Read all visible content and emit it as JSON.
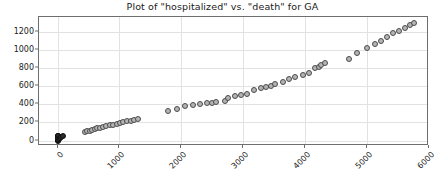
{
  "chart_data": {
    "type": "scatter",
    "title": "Plot of \"hospitalized\" vs. \"death\" for GA",
    "xlabel": "",
    "ylabel": "",
    "xlim": [
      -300,
      6000
    ],
    "ylim": [
      -60,
      1360
    ],
    "grid": true,
    "legend": null,
    "marker": {
      "shape": "circle",
      "facecolor": "#b4b4b4",
      "edgecolor": "#4c4c4c",
      "size": 6
    },
    "xticks": [
      0,
      1000,
      2000,
      3000,
      4000,
      5000,
      6000
    ],
    "xtick_labels": [
      "0",
      "1000",
      "2000",
      "3000",
      "4000",
      "5000",
      "6000"
    ],
    "xtick_rotation": -45,
    "yticks": [
      0,
      200,
      400,
      600,
      800,
      1000,
      1200
    ],
    "ytick_labels": [
      "0",
      "200",
      "400",
      "600",
      "800",
      "1000",
      "1200"
    ],
    "series_name": "hospitalized vs death",
    "x": [
      0,
      0,
      0,
      0,
      0,
      0,
      0,
      0,
      0,
      0,
      0,
      0,
      0,
      0,
      0,
      0,
      0,
      0,
      20,
      40,
      60,
      80,
      440,
      480,
      520,
      560,
      600,
      640,
      690,
      740,
      790,
      840,
      900,
      960,
      1010,
      1060,
      1120,
      1180,
      1240,
      1300,
      1790,
      1930,
      2060,
      2180,
      2300,
      2420,
      2500,
      2560,
      2700,
      2760,
      2860,
      2960,
      3060,
      3180,
      3280,
      3360,
      3440,
      3520,
      3640,
      3740,
      3840,
      3960,
      4060,
      4160,
      4220,
      4260,
      4320,
      4700,
      4840,
      5000,
      5120,
      5220,
      5320,
      5420,
      5520,
      5620,
      5700,
      5760
    ],
    "y": [
      0,
      5,
      10,
      14,
      18,
      22,
      26,
      30,
      34,
      38,
      42,
      46,
      50,
      54,
      12,
      8,
      4,
      2,
      20,
      30,
      40,
      50,
      90,
      100,
      110,
      118,
      126,
      134,
      142,
      150,
      158,
      166,
      175,
      184,
      192,
      200,
      210,
      218,
      226,
      234,
      330,
      352,
      380,
      390,
      400,
      408,
      416,
      424,
      440,
      470,
      486,
      500,
      516,
      560,
      576,
      590,
      604,
      618,
      650,
      680,
      700,
      724,
      748,
      800,
      812,
      830,
      850,
      900,
      960,
      1020,
      1060,
      1100,
      1140,
      1180,
      1210,
      1240,
      1270,
      1290
    ],
    "dense_cluster_note": "overlapping points near origin rendered darker"
  }
}
